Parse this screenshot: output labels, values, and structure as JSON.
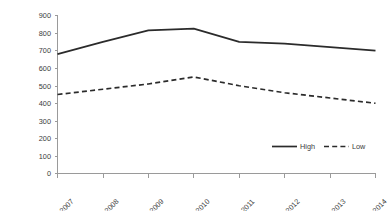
{
  "chart_data": {
    "type": "line",
    "title": "",
    "subtitle": "",
    "xlabel": "",
    "ylabel": "",
    "categories": [
      "2007",
      "2008",
      "2009",
      "2010",
      "2011",
      "2012",
      "2013",
      "2014"
    ],
    "series": [
      {
        "name": "High",
        "values": [
          680,
          750,
          815,
          825,
          750,
          740,
          720,
          700
        ],
        "style": "solid"
      },
      {
        "name": "Low",
        "values": [
          450,
          480,
          510,
          550,
          500,
          460,
          430,
          400
        ],
        "style": "dashed"
      }
    ],
    "ylim": [
      0,
      900
    ],
    "ytick_step": 100,
    "yticks": [
      "0",
      "100",
      "200",
      "300",
      "400",
      "500",
      "600",
      "700",
      "800",
      "900"
    ],
    "grid": false,
    "legend_position": "inside-bottom-right",
    "xtick_rotation": 45,
    "colors": {
      "series_high": "#2b2b2b",
      "series_low": "#2b2b2b",
      "axis": "#9a9a9a",
      "text": "#3b3b3b",
      "background": "#ffffff"
    }
  },
  "legend": {
    "entries": [
      {
        "label": "High"
      },
      {
        "label": "Low"
      }
    ]
  }
}
